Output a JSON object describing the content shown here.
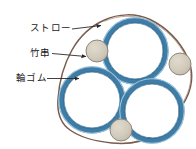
{
  "diagram": {
    "labels": [
      {
        "id": "straw",
        "text": "ストロー",
        "leader": "arrow-right"
      },
      {
        "id": "skewer",
        "text": "竹串",
        "leader": "arrow-right"
      },
      {
        "id": "rubber",
        "text": "輪ゴム",
        "leader": "arrow-right"
      }
    ],
    "colors": {
      "straw_ring_outer": "#5b9bc4",
      "straw_ring_inner": "#2f6b93",
      "straw_ring_light": "#a8cde4",
      "skewer_fill": "#cdc6b8",
      "skewer_stroke": "#8d8879",
      "rubber_band": "#7a5c4e",
      "leader_line": "#2b2b2b",
      "text": "#1b1b1b",
      "background": "#ffffff"
    },
    "straws": [
      {
        "name": "straw-top",
        "cx": 135,
        "cy": 51,
        "r": 31
      },
      {
        "name": "straw-bottom-left",
        "cx": 92,
        "cy": 100,
        "r": 31
      },
      {
        "name": "straw-bottom-right",
        "cx": 152,
        "cy": 111,
        "r": 30
      }
    ],
    "skewers": [
      {
        "name": "skewer-upper-left",
        "cx": 97,
        "cy": 51,
        "r": 11
      },
      {
        "name": "skewer-right",
        "cx": 180,
        "cy": 64,
        "r": 11
      },
      {
        "name": "skewer-bottom",
        "cx": 121,
        "cy": 130,
        "r": 11
      }
    ],
    "leaders": [
      {
        "name": "leader-straw",
        "x1": 72,
        "y1": 29,
        "x2": 101,
        "y2": 25
      },
      {
        "name": "leader-skewer",
        "x1": 52,
        "y1": 54,
        "x2": 86,
        "y2": 57
      },
      {
        "name": "leader-rubber",
        "x1": 47,
        "y1": 79,
        "x2": 79,
        "y2": 79
      }
    ]
  }
}
